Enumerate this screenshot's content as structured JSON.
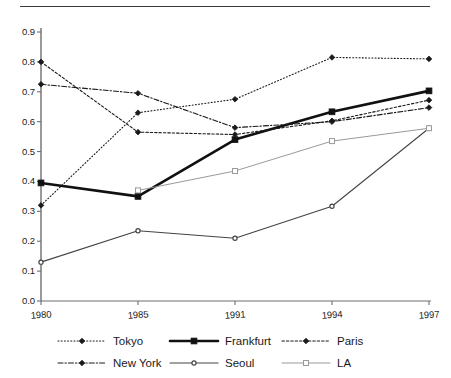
{
  "chart_data": {
    "type": "line",
    "title": "",
    "subtitle": "",
    "xlabel": "",
    "ylabel": "",
    "categories": [
      "1980",
      "1985",
      "1991",
      "1994",
      "1997"
    ],
    "ylim": [
      0.0,
      0.9
    ],
    "ytick_labels": [
      "0.0",
      "0.1",
      "0.2",
      "0.3",
      "0.4",
      "0.5",
      "0.6",
      "0.7",
      "0.8",
      "0.9"
    ],
    "ytick_values": [
      0.0,
      0.1,
      0.2,
      0.3,
      0.4,
      0.5,
      0.6,
      0.7,
      0.8,
      0.9
    ],
    "grid": false,
    "legend_position": "bottom",
    "series": [
      {
        "name": "Tokyo",
        "values": [
          0.32,
          0.63,
          0.675,
          0.815,
          0.81
        ],
        "color": "#1a1a1a",
        "line_style": "dotted",
        "line_width": 1.1,
        "marker": "diamond",
        "marker_fill": "#1a1a1a"
      },
      {
        "name": "Frankfurt",
        "values": [
          0.395,
          0.35,
          0.54,
          0.633,
          0.703
        ],
        "color": "#111111",
        "line_style": "solid",
        "line_width": 2.6,
        "marker": "square",
        "marker_fill": "#111111"
      },
      {
        "name": "Paris",
        "values": [
          0.8,
          0.565,
          0.557,
          0.603,
          0.672
        ],
        "color": "#1a1a1a",
        "line_style": "dashed",
        "line_width": 1.1,
        "marker": "diamond",
        "marker_fill": "#1a1a1a"
      },
      {
        "name": "New York",
        "values": [
          0.725,
          0.695,
          0.58,
          0.6,
          0.647
        ],
        "color": "#1a1a1a",
        "line_style": "dash-dot",
        "line_width": 1.1,
        "marker": "diamond",
        "marker_fill": "#1a1a1a"
      },
      {
        "name": "Seoul",
        "values": [
          0.13,
          0.235,
          0.21,
          0.317,
          0.578
        ],
        "color": "#444444",
        "line_style": "solid",
        "line_width": 1.1,
        "marker": "circle-small",
        "marker_fill": "#444444"
      },
      {
        "name": "LA",
        "values": [
          null,
          0.37,
          0.435,
          0.535,
          0.578
        ],
        "color": "#9a9a9a",
        "line_style": "solid",
        "line_width": 1.0,
        "marker": "square-open",
        "marker_fill": "#ffffff"
      }
    ]
  },
  "legend": {
    "entries": [
      {
        "label": "Tokyo",
        "series": "Tokyo"
      },
      {
        "label": "Frankfurt",
        "series": "Frankfurt"
      },
      {
        "label": "Paris",
        "series": "Paris"
      },
      {
        "label": "New York",
        "series": "New York"
      },
      {
        "label": "Seoul",
        "series": "Seoul"
      },
      {
        "label": "LA",
        "series": "LA"
      }
    ]
  },
  "axes": {
    "y_ticks": [
      "0.9",
      "0.8",
      "0.7",
      "0.6",
      "0.5",
      "0.4",
      "0.3",
      "0.2",
      "0.1",
      "0.0"
    ],
    "x_ticks": [
      "1980",
      "1985",
      "1991",
      "1994",
      "1997"
    ]
  }
}
